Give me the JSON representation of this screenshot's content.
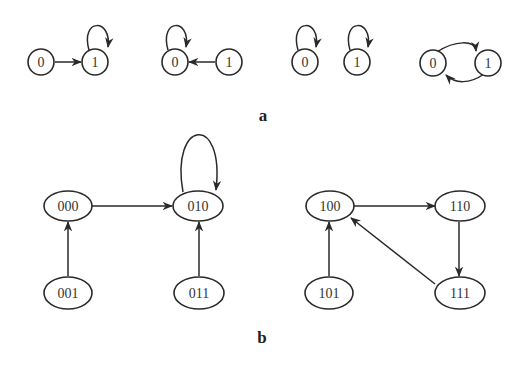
{
  "figure": {
    "panel_a": {
      "caption": "a",
      "graphs": [
        {
          "nodes": [
            "0",
            "1"
          ],
          "edges": [
            "0->1",
            "1->1"
          ]
        },
        {
          "nodes": [
            "0",
            "1"
          ],
          "edges": [
            "1->0",
            "0->0"
          ]
        },
        {
          "nodes": [
            "0"
          ],
          "edges": [
            "0->0"
          ]
        },
        {
          "nodes": [
            "1"
          ],
          "edges": [
            "1->1"
          ]
        },
        {
          "nodes": [
            "0",
            "1"
          ],
          "edges": [
            "0->1",
            "1->0"
          ]
        }
      ]
    },
    "panel_b": {
      "caption": "b",
      "nodes": [
        "000",
        "010",
        "001",
        "011",
        "100",
        "110",
        "101",
        "111"
      ],
      "edges": [
        "000->010",
        "010->010",
        "001->000",
        "011->010",
        "100->110",
        "110->111",
        "111->100",
        "101->100"
      ]
    }
  },
  "labels": {
    "a_g1_n0": "0",
    "a_g1_n1": "1",
    "a_g2_n0": "0",
    "a_g2_n1": "1",
    "a_g3_n0": "0",
    "a_g4_n1": "1",
    "a_g5_n0": "0",
    "a_g5_n1": "1",
    "b_000": "000",
    "b_010": "010",
    "b_001": "001",
    "b_011": "011",
    "b_100": "100",
    "b_110": "110",
    "b_101": "101",
    "b_111": "111"
  }
}
